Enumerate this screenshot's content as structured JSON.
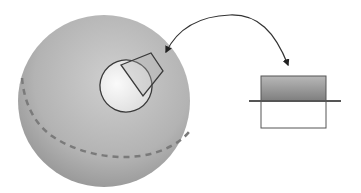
{
  "diagram": {
    "colors": {
      "background": "#ffffff",
      "sphere_light": "#c9c9c9",
      "sphere_dark": "#9a9a9a",
      "patch_fill": "#efefef",
      "outline": "#3a3a3a",
      "dashed_line": "#7a7a7a",
      "box_top_light": "#b0b0b0",
      "box_top_dark": "#808080",
      "box_bottom": "#ffffff",
      "arrow": "#222222"
    },
    "elements": {
      "sphere": {
        "label": "sphere"
      },
      "equator": {
        "label": "dashed-equator"
      },
      "patch": {
        "label": "surface-patch"
      },
      "probe": {
        "label": "cone-probe"
      },
      "arrow": {
        "label": "curved-double-arrow"
      },
      "box": {
        "label": "cross-section-box"
      },
      "surface_line": {
        "label": "horizontal-surface-line"
      }
    }
  }
}
